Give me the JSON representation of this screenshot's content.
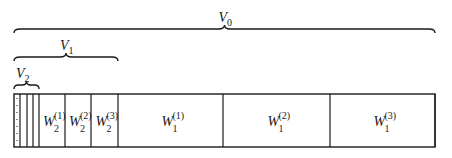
{
  "diagram": {
    "type": "nested-subspace-decomposition",
    "colors": {
      "stroke": "#1a1a1a",
      "background": "#ffffff"
    },
    "braces": [
      {
        "id": "V0",
        "label_base": "V",
        "label_sub": "0",
        "from_x": 14,
        "to_x": 435,
        "y": 29
      },
      {
        "id": "V1",
        "label_base": "V",
        "label_sub": "1",
        "from_x": 14,
        "to_x": 118,
        "y": 57
      },
      {
        "id": "V2",
        "label_base": "V",
        "label_sub": "2",
        "from_x": 14,
        "to_x": 39,
        "y": 85
      }
    ],
    "box": {
      "x": 14,
      "y": 94,
      "width": 421,
      "height": 53
    },
    "small_cells": {
      "dividers_x": [
        20,
        27,
        33,
        39
      ],
      "dotted_x": 17,
      "note": "unlabeled narrow cells (coarser levels), dotted leftmost"
    },
    "cells": [
      {
        "id": "W2_1",
        "base": "W",
        "sub": "2",
        "sup": "(1)",
        "x0": 39,
        "x1": 65
      },
      {
        "id": "W2_2",
        "base": "W",
        "sub": "2",
        "sup": "(2)",
        "x0": 65,
        "x1": 91
      },
      {
        "id": "W2_3",
        "base": "W",
        "sub": "2",
        "sup": "(3)",
        "x0": 91,
        "x1": 118
      },
      {
        "id": "W1_1",
        "base": "W",
        "sub": "1",
        "sup": "(1)",
        "x0": 118,
        "x1": 223
      },
      {
        "id": "W1_2",
        "base": "W",
        "sub": "1",
        "sup": "(2)",
        "x0": 223,
        "x1": 330
      },
      {
        "id": "W1_3",
        "base": "W",
        "sub": "1",
        "sup": "(3)",
        "x0": 330,
        "x1": 435
      }
    ]
  }
}
